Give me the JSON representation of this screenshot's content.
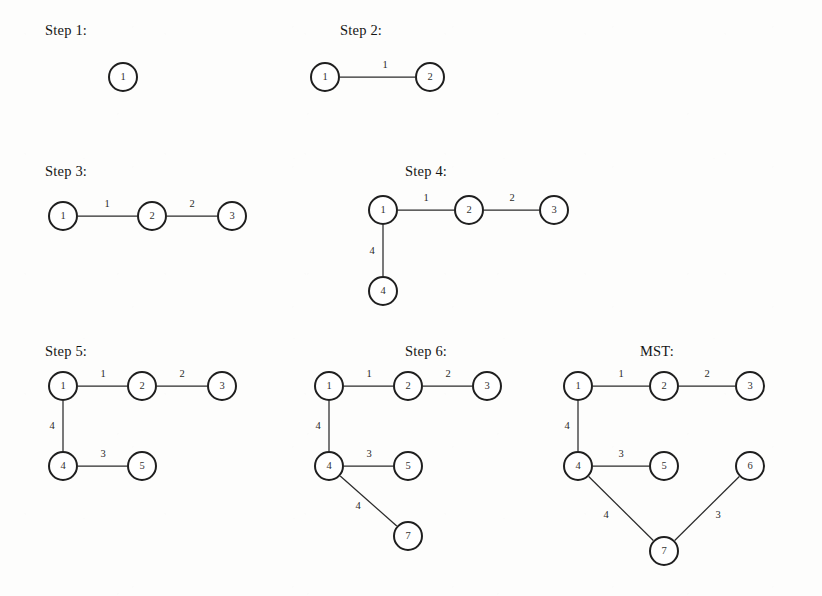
{
  "figure": {
    "width": 822,
    "height": 596,
    "background_color": "#fdfdfc",
    "node_stroke_color": "#1f1f1f",
    "edge_stroke_color": "#2b2b2b",
    "text_color": "#1a1a1a"
  },
  "panels": [
    {
      "id": "step-1",
      "title": "Step 1:",
      "title_x": 45,
      "title_y": 22,
      "nodes": [
        {
          "label": "1",
          "x": 123,
          "y": 77
        }
      ],
      "edges": []
    },
    {
      "id": "step-2",
      "title": "Step 2:",
      "title_x": 340,
      "title_y": 22,
      "nodes": [
        {
          "label": "1",
          "x": 325,
          "y": 77
        },
        {
          "label": "2",
          "x": 430,
          "y": 77
        }
      ],
      "edges": [
        {
          "from": "1",
          "to": "2",
          "weight": "1",
          "label_x": 385,
          "label_y": 65
        }
      ]
    },
    {
      "id": "step-3",
      "title": "Step 3:",
      "title_x": 45,
      "title_y": 163,
      "nodes": [
        {
          "label": "1",
          "x": 63,
          "y": 216
        },
        {
          "label": "2",
          "x": 152,
          "y": 216
        },
        {
          "label": "3",
          "x": 232,
          "y": 216
        }
      ],
      "edges": [
        {
          "from": "1",
          "to": "2",
          "weight": "1",
          "label_x": 107,
          "label_y": 204
        },
        {
          "from": "2",
          "to": "3",
          "weight": "2",
          "label_x": 192,
          "label_y": 204
        }
      ]
    },
    {
      "id": "step-4",
      "title": "Step 4:",
      "title_x": 405,
      "title_y": 163,
      "nodes": [
        {
          "label": "1",
          "x": 383,
          "y": 210
        },
        {
          "label": "2",
          "x": 469,
          "y": 210
        },
        {
          "label": "3",
          "x": 554,
          "y": 210
        },
        {
          "label": "4",
          "x": 383,
          "y": 291
        }
      ],
      "edges": [
        {
          "from": "1",
          "to": "2",
          "weight": "1",
          "label_x": 426,
          "label_y": 198
        },
        {
          "from": "2",
          "to": "3",
          "weight": "2",
          "label_x": 512,
          "label_y": 198
        },
        {
          "from": "1",
          "to": "4",
          "weight": "4",
          "label_x": 372,
          "label_y": 251
        }
      ]
    },
    {
      "id": "step-5",
      "title": "Step 5:",
      "title_x": 45,
      "title_y": 343,
      "nodes": [
        {
          "label": "1",
          "x": 63,
          "y": 386
        },
        {
          "label": "2",
          "x": 142,
          "y": 386
        },
        {
          "label": "3",
          "x": 222,
          "y": 386
        },
        {
          "label": "4",
          "x": 63,
          "y": 466
        },
        {
          "label": "5",
          "x": 142,
          "y": 466
        }
      ],
      "edges": [
        {
          "from": "1",
          "to": "2",
          "weight": "1",
          "label_x": 103,
          "label_y": 374
        },
        {
          "from": "2",
          "to": "3",
          "weight": "2",
          "label_x": 182,
          "label_y": 374
        },
        {
          "from": "1",
          "to": "4",
          "weight": "4",
          "label_x": 52,
          "label_y": 426
        },
        {
          "from": "4",
          "to": "5",
          "weight": "3",
          "label_x": 103,
          "label_y": 454
        }
      ]
    },
    {
      "id": "step-6",
      "title": "Step 6:",
      "title_x": 405,
      "title_y": 343,
      "nodes": [
        {
          "label": "1",
          "x": 329,
          "y": 386
        },
        {
          "label": "2",
          "x": 408,
          "y": 386
        },
        {
          "label": "3",
          "x": 487,
          "y": 386
        },
        {
          "label": "4",
          "x": 329,
          "y": 466
        },
        {
          "label": "5",
          "x": 408,
          "y": 466
        },
        {
          "label": "7",
          "x": 408,
          "y": 536
        }
      ],
      "edges": [
        {
          "from": "1",
          "to": "2",
          "weight": "1",
          "label_x": 369,
          "label_y": 374
        },
        {
          "from": "2",
          "to": "3",
          "weight": "2",
          "label_x": 448,
          "label_y": 374
        },
        {
          "from": "1",
          "to": "4",
          "weight": "4",
          "label_x": 318,
          "label_y": 426
        },
        {
          "from": "4",
          "to": "5",
          "weight": "3",
          "label_x": 369,
          "label_y": 454
        },
        {
          "from": "4",
          "to": "7",
          "weight": "4",
          "label_x": 358,
          "label_y": 506
        }
      ]
    },
    {
      "id": "mst",
      "title": "MST:",
      "title_x": 640,
      "title_y": 343,
      "nodes": [
        {
          "label": "1",
          "x": 578,
          "y": 386
        },
        {
          "label": "2",
          "x": 664,
          "y": 386
        },
        {
          "label": "3",
          "x": 750,
          "y": 386
        },
        {
          "label": "4",
          "x": 578,
          "y": 466
        },
        {
          "label": "5",
          "x": 664,
          "y": 466
        },
        {
          "label": "6",
          "x": 750,
          "y": 466
        },
        {
          "label": "7",
          "x": 664,
          "y": 551
        }
      ],
      "edges": [
        {
          "from": "1",
          "to": "2",
          "weight": "1",
          "label_x": 621,
          "label_y": 374
        },
        {
          "from": "2",
          "to": "3",
          "weight": "2",
          "label_x": 707,
          "label_y": 374
        },
        {
          "from": "1",
          "to": "4",
          "weight": "4",
          "label_x": 567,
          "label_y": 426
        },
        {
          "from": "4",
          "to": "5",
          "weight": "3",
          "label_x": 621,
          "label_y": 454
        },
        {
          "from": "4",
          "to": "7",
          "weight": "4",
          "label_x": 606,
          "label_y": 515
        },
        {
          "from": "6",
          "to": "7",
          "weight": "3",
          "label_x": 718,
          "label_y": 515
        }
      ]
    }
  ]
}
